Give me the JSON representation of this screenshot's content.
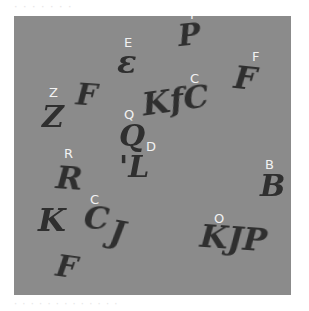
{
  "canvas": {
    "background": "#8b8b8b",
    "glyph_color": "#2f2f2f",
    "label_color": "#f2f2f2"
  },
  "labels": [
    {
      "text": "P",
      "x": 176,
      "y": -8
    },
    {
      "text": "E",
      "x": 110,
      "y": 20
    },
    {
      "text": "F",
      "x": 238,
      "y": 34
    },
    {
      "text": "C",
      "x": 176,
      "y": 56
    },
    {
      "text": "Z",
      "x": 35,
      "y": 70
    },
    {
      "text": "Q",
      "x": 110,
      "y": 92
    },
    {
      "text": "D",
      "x": 132,
      "y": 124
    },
    {
      "text": "R",
      "x": 50,
      "y": 131
    },
    {
      "text": "B",
      "x": 251,
      "y": 142
    },
    {
      "text": "C",
      "x": 76,
      "y": 177
    },
    {
      "text": "O",
      "x": 200,
      "y": 196
    }
  ],
  "glyphs": [
    {
      "text": "P",
      "x": 164,
      "y": 4,
      "size": 30,
      "rotate": -6
    },
    {
      "text": "ε",
      "x": 103,
      "y": 30,
      "size": 32,
      "rotate": 0
    },
    {
      "text": "F",
      "x": 220,
      "y": 46,
      "size": 32,
      "rotate": 6
    },
    {
      "text": "F",
      "x": 62,
      "y": 64,
      "size": 30,
      "rotate": 4
    },
    {
      "text": "Z",
      "x": 28,
      "y": 86,
      "size": 30,
      "rotate": 0
    },
    {
      "text": "KfC",
      "x": 128,
      "y": 68,
      "size": 32,
      "rotate": -8
    },
    {
      "text": "Q",
      "x": 105,
      "y": 105,
      "size": 30,
      "rotate": 0
    },
    {
      "text": "'L",
      "x": 105,
      "y": 136,
      "size": 30,
      "rotate": 0
    },
    {
      "text": "R",
      "x": 42,
      "y": 146,
      "size": 32,
      "rotate": 4
    },
    {
      "text": "B",
      "x": 246,
      "y": 155,
      "size": 30,
      "rotate": 0
    },
    {
      "text": "K",
      "x": 24,
      "y": 188,
      "size": 32,
      "rotate": 0
    },
    {
      "text": "C",
      "x": 70,
      "y": 186,
      "size": 32,
      "rotate": 4
    },
    {
      "text": "J",
      "x": 96,
      "y": 200,
      "size": 32,
      "rotate": 10
    },
    {
      "text": "KJP",
      "x": 186,
      "y": 206,
      "size": 32,
      "rotate": 4
    },
    {
      "text": "F",
      "x": 42,
      "y": 236,
      "size": 30,
      "rotate": 8
    }
  ],
  "top_text": "· · · · · · ·",
  "bottom_text": "· · · · · · · · · · · · ·"
}
